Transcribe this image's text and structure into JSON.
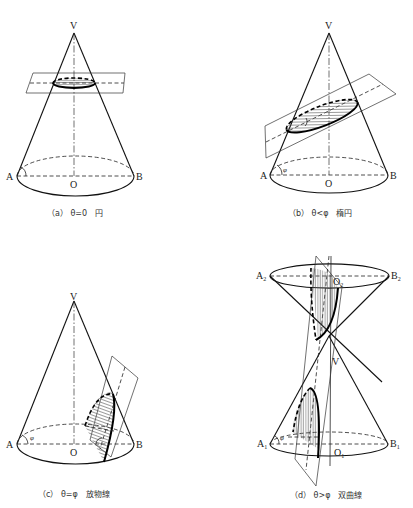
{
  "figure": {
    "panels": [
      {
        "id": "a",
        "caption": "（a） θ=0　円",
        "labels": {
          "apex": "V",
          "left": "A",
          "right": "B",
          "center": "O"
        }
      },
      {
        "id": "b",
        "caption": "（b） θ<φ　楕円",
        "labels": {
          "apex": "V",
          "left": "A",
          "right": "B",
          "center": "O",
          "angle": "φ",
          "section_angle": "θ"
        }
      },
      {
        "id": "c",
        "caption": "（c） θ=φ　放物線",
        "labels": {
          "apex": "V",
          "left": "A",
          "right": "B",
          "center": "O",
          "angle": "φ"
        }
      },
      {
        "id": "d",
        "caption": "（d） θ>φ　双曲線",
        "labels": {
          "apex": "V",
          "upper_left": "A",
          "upper_left_sub": "2",
          "upper_right": "B",
          "upper_right_sub": "2",
          "upper_center": "O",
          "upper_center_sub": "2",
          "lower_left": "A",
          "lower_left_sub": "1",
          "lower_right": "B",
          "lower_right_sub": "1",
          "lower_center": "O",
          "lower_center_sub": "1",
          "angle": "φ",
          "section_angle": "θ"
        }
      }
    ]
  }
}
